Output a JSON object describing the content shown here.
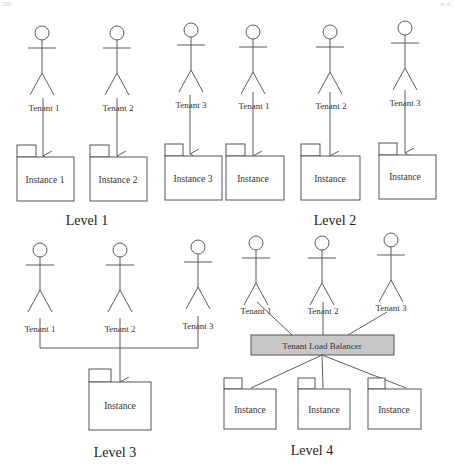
{
  "header": {
    "left": "200",
    "right": "et al."
  },
  "colors": {
    "line": "#5a5a5a",
    "load_balancer_fill": "#c8c8c8",
    "text": "#333333"
  },
  "levels": [
    {
      "label": "Level 1",
      "tenants": [
        "Tenant 1",
        "Tenant 2",
        "Tenant 3"
      ],
      "instances": [
        "Instance  1",
        "Instance  2",
        "Instance  3"
      ]
    },
    {
      "label": "Level 2",
      "tenants": [
        "Tenant 1",
        "Tenant 2",
        "Tenant 3"
      ],
      "instances": [
        "Instance",
        "Instance",
        "Instance"
      ]
    },
    {
      "label": "Level 3",
      "tenants": [
        "Tenant 1",
        "Tenant 2",
        "Tenant 3"
      ],
      "instances": [
        "Instance"
      ]
    },
    {
      "label": "Level 4",
      "tenants": [
        "Tenant 1",
        "Tenant 2",
        "Tenant 3"
      ],
      "load_balancer": "Tenant Load Balancer",
      "instances": [
        "Instance",
        "Instance",
        "Instance"
      ]
    }
  ]
}
